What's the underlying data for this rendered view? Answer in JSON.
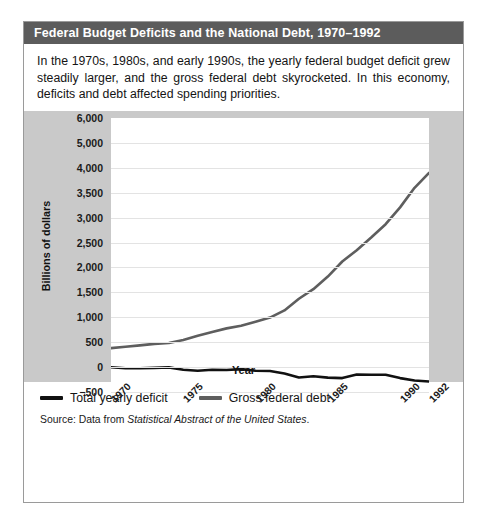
{
  "figure": {
    "title": "Federal Budget Deficits and the National Debt, 1970–1992",
    "description": "In the 1970s, 1980s, and early 1990s, the yearly federal budget deficit grew steadily larger, and the gross federal debt skyrocketed. In this economy, deficits and debt affected spending priorities.",
    "source_prefix": "Source: Data from ",
    "source_italic": "Statistical Abstract of the United States",
    "source_suffix": "."
  },
  "colors": {
    "title_bar": "#5c5c5c",
    "panel": "#c9c9c9",
    "plot_background": "#ffffff",
    "gridline": "#e3e3e3",
    "deficit_line": "#111111",
    "debt_line": "#5e5e5e",
    "border": "#9a9a9a"
  },
  "chart_data": {
    "type": "line",
    "title": "Federal Budget Deficits and the National Debt, 1970–1992",
    "xlabel": "Year",
    "ylabel": "Billions of dollars",
    "grid": true,
    "legend_position": "bottom",
    "xlim": [
      1970,
      1992
    ],
    "xticks": [
      1970,
      1975,
      1980,
      1985,
      1990,
      1992
    ],
    "xtick_labels": [
      "1970",
      "1975",
      "1980",
      "1985",
      "1990",
      "1992"
    ],
    "ytick_labels": [
      "6,000",
      "5,000",
      "4,000",
      "3,500",
      "3,000",
      "2,500",
      "2,000",
      "1,500",
      "1,000",
      "500",
      "0",
      "−500"
    ],
    "ytick_values": [
      6000,
      5000,
      4000,
      3500,
      3000,
      2500,
      2000,
      1500,
      1000,
      500,
      0,
      -500
    ],
    "x": [
      1970,
      1971,
      1972,
      1973,
      1974,
      1975,
      1976,
      1977,
      1978,
      1979,
      1980,
      1981,
      1982,
      1983,
      1984,
      1985,
      1986,
      1987,
      1988,
      1989,
      1990,
      1991,
      1992
    ],
    "series": [
      {
        "name": "Total yearly deficit",
        "color": "#111111",
        "values": [
          -3,
          -23,
          -23,
          -15,
          -6,
          -53,
          -74,
          -54,
          -59,
          -41,
          -74,
          -79,
          -128,
          -208,
          -185,
          -212,
          -221,
          -150,
          -155,
          -153,
          -221,
          -269,
          -290
        ]
      },
      {
        "name": "Gross federal debt",
        "color": "#5e5e5e",
        "values": [
          381,
          408,
          436,
          466,
          484,
          542,
          629,
          706,
          777,
          829,
          909,
          994,
          1137,
          1371,
          1564,
          1817,
          2120,
          2346,
          2601,
          2868,
          3206,
          3598,
          3900
        ]
      }
    ]
  },
  "legend": {
    "items": [
      {
        "label": "Total yearly deficit",
        "color": "#111111"
      },
      {
        "label": "Gross federal debt",
        "color": "#5e5e5e"
      }
    ]
  }
}
